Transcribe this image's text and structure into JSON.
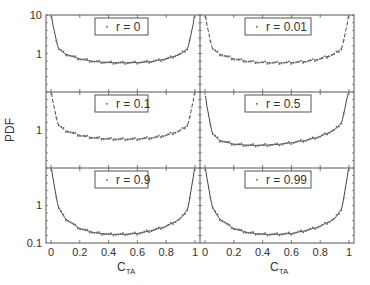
{
  "chart_data": {
    "type": "line",
    "layout": "3x2 grid of panels, shared axes",
    "ylabel": "PDF",
    "xlabel": "C",
    "xlabel_sub": "TA",
    "xlim": [
      0,
      1
    ],
    "ylim": [
      0.1,
      10
    ],
    "yscale": "log",
    "x_ticks": [
      "0",
      "0.2",
      "0.4",
      "0.6",
      "0.8",
      "1"
    ],
    "y_ticks_top": [
      "10",
      "1"
    ],
    "y_ticks_mid": [
      "1"
    ],
    "y_ticks_bottom": [
      "1",
      "0.1"
    ],
    "grid": false,
    "panels": [
      {
        "label": "r = 0",
        "row": 0,
        "col": 0,
        "line_style": "solid",
        "x": [
          0.01,
          0.05,
          0.1,
          0.2,
          0.3,
          0.4,
          0.5,
          0.6,
          0.7,
          0.8,
          0.9,
          0.95,
          0.99
        ],
        "y": [
          6.4,
          1.46,
          1.06,
          0.8,
          0.69,
          0.65,
          0.64,
          0.65,
          0.69,
          0.8,
          1.06,
          1.46,
          6.4
        ]
      },
      {
        "label": "r = 0.01",
        "row": 0,
        "col": 1,
        "line_style": "dashed",
        "x": [
          0.01,
          0.05,
          0.1,
          0.2,
          0.3,
          0.4,
          0.5,
          0.6,
          0.7,
          0.8,
          0.9,
          0.95,
          0.99
        ],
        "y": [
          6.4,
          1.46,
          1.06,
          0.8,
          0.69,
          0.65,
          0.64,
          0.65,
          0.69,
          0.8,
          1.06,
          1.46,
          6.4
        ]
      },
      {
        "label": "r = 0.1",
        "row": 1,
        "col": 0,
        "line_style": "dashed",
        "x": [
          0.01,
          0.05,
          0.1,
          0.2,
          0.3,
          0.4,
          0.5,
          0.6,
          0.7,
          0.8,
          0.9,
          0.95,
          0.99
        ],
        "y": [
          6.4,
          1.46,
          1.06,
          0.8,
          0.69,
          0.65,
          0.64,
          0.65,
          0.69,
          0.8,
          1.06,
          1.46,
          6.4
        ]
      },
      {
        "label": "r = 0.5",
        "row": 1,
        "col": 1,
        "line_style": "solid",
        "x": [
          0.01,
          0.05,
          0.1,
          0.2,
          0.3,
          0.4,
          0.5,
          0.6,
          0.7,
          0.8,
          0.9,
          0.95,
          0.99
        ],
        "y": [
          5.0,
          0.9,
          0.6,
          0.48,
          0.45,
          0.45,
          0.47,
          0.52,
          0.6,
          0.75,
          1.1,
          1.7,
          8.0
        ]
      },
      {
        "label": "r = 0.9",
        "row": 2,
        "col": 0,
        "line_style": "solid",
        "x": [
          0.01,
          0.05,
          0.1,
          0.2,
          0.3,
          0.4,
          0.5,
          0.6,
          0.7,
          0.8,
          0.9,
          0.95,
          0.99
        ],
        "y": [
          6.4,
          1.0,
          0.5,
          0.28,
          0.22,
          0.2,
          0.2,
          0.21,
          0.25,
          0.32,
          0.5,
          0.9,
          6.4
        ]
      },
      {
        "label": "r = 0.99",
        "row": 2,
        "col": 1,
        "line_style": "solid",
        "x": [
          0.01,
          0.05,
          0.1,
          0.2,
          0.3,
          0.4,
          0.5,
          0.6,
          0.7,
          0.8,
          0.9,
          0.95,
          0.99
        ],
        "y": [
          6.4,
          1.0,
          0.5,
          0.28,
          0.22,
          0.2,
          0.2,
          0.21,
          0.25,
          0.32,
          0.5,
          0.9,
          6.4
        ]
      }
    ],
    "legend_marker": "·"
  },
  "labels": {
    "ylabel": "PDF",
    "xlabel_main": "C",
    "xlabel_sub": "TA",
    "ytick_10": "10",
    "ytick_1": "1",
    "ytick_01": "0.1",
    "xticks": [
      "0",
      "0.2",
      "0.4",
      "0.6",
      "0.8",
      "1"
    ],
    "legend_marker": "·",
    "panel_labels": [
      "r = 0",
      "r = 0.01",
      "r = 0.1",
      "r = 0.5",
      "r = 0.9",
      "r = 0.99"
    ]
  }
}
